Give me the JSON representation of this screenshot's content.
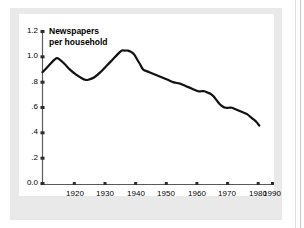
{
  "chart_data": {
    "type": "line",
    "title": "Newspapers per household",
    "title_line1": "Newspapers",
    "title_line2": "per household",
    "xlabel": "",
    "ylabel": "",
    "xlim": [
      1915,
      1990
    ],
    "ylim": [
      0.0,
      1.2
    ],
    "grid": false,
    "legend": null,
    "line_color": "#111111",
    "background_color": "#ffffff",
    "panel_color": "#e9e9e9",
    "yticks": [
      {
        "value": 1.2,
        "label": "1.2"
      },
      {
        "value": 1.0,
        "label": "1.0"
      },
      {
        "value": 0.8,
        "label": ".8"
      },
      {
        "value": 0.6,
        "label": ".6"
      },
      {
        "value": 0.4,
        "label": ".4"
      },
      {
        "value": 0.2,
        "label": ".2"
      },
      {
        "value": 0.0,
        "label": "0.0"
      }
    ],
    "xticks": [
      {
        "value": 1920,
        "label": "1920"
      },
      {
        "value": 1930,
        "label": "1930"
      },
      {
        "value": 1940,
        "label": "1940"
      },
      {
        "value": 1950,
        "label": "1950"
      },
      {
        "value": 1960,
        "label": "1960"
      },
      {
        "value": 1970,
        "label": "1970"
      },
      {
        "value": 1980,
        "label": "1980"
      },
      {
        "value": 1990,
        "label": "1990"
      }
    ],
    "series": [
      {
        "name": "Newspapers per household",
        "x": [
          1915,
          1917,
          1919,
          1920,
          1922,
          1924,
          1926,
          1928,
          1929,
          1930,
          1932,
          1934,
          1936,
          1938,
          1940,
          1941,
          1942,
          1943,
          1944,
          1945,
          1946,
          1947,
          1948,
          1950,
          1952,
          1954,
          1956,
          1958,
          1960,
          1962,
          1964,
          1966,
          1967,
          1968,
          1969,
          1970,
          1971,
          1972,
          1973,
          1974,
          1975,
          1976,
          1977,
          1978,
          1979,
          1980,
          1981,
          1982,
          1983,
          1984,
          1985,
          1986
        ],
        "y": [
          0.88,
          0.93,
          0.98,
          0.99,
          0.95,
          0.9,
          0.86,
          0.83,
          0.82,
          0.82,
          0.84,
          0.88,
          0.93,
          0.98,
          1.03,
          1.05,
          1.05,
          1.05,
          1.04,
          1.02,
          0.98,
          0.94,
          0.9,
          0.88,
          0.86,
          0.84,
          0.82,
          0.8,
          0.79,
          0.77,
          0.75,
          0.73,
          0.73,
          0.73,
          0.72,
          0.71,
          0.69,
          0.66,
          0.63,
          0.61,
          0.6,
          0.6,
          0.6,
          0.59,
          0.58,
          0.57,
          0.56,
          0.55,
          0.53,
          0.51,
          0.49,
          0.46
        ]
      }
    ]
  }
}
